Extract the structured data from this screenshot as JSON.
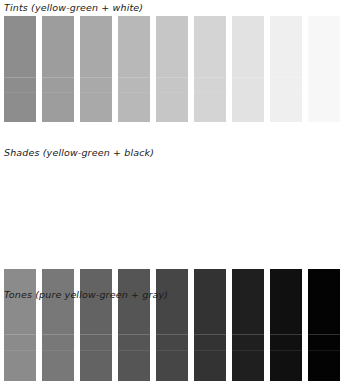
{
  "page": {
    "background": "#ffffff",
    "width": 341,
    "height": 307,
    "text_color": "#1a1a1a"
  },
  "sections": [
    {
      "id": "tints",
      "label": "Tints (yellow-green + white)",
      "description": "Nine swatches of yellow-green progressively mixed with white, reproduced in grayscale",
      "swatch_count": 9,
      "colors": [
        "#8d8d8d",
        "#9d9d9d",
        "#a9a9a9",
        "#b8b8b8",
        "#c6c6c6",
        "#d4d4d4",
        "#e2e2e2",
        "#efefef",
        "#f7f7f7"
      ]
    },
    {
      "id": "shades",
      "label": "Shades (yellow-green + black)",
      "description": "Nine swatches of yellow-green progressively mixed with black, reproduced in grayscale",
      "swatch_count": 9,
      "colors": [
        "#8b8b8b",
        "#787878",
        "#636363",
        "#555555",
        "#464646",
        "#333333",
        "#1f1f1f",
        "#101010",
        "#030303"
      ]
    },
    {
      "id": "tones",
      "label": "Tones (pure yellow-green + gray)",
      "description": "Section heading only; its swatch row is cut off below the bottom edge of the image",
      "swatch_count": 0,
      "colors": []
    }
  ],
  "swatch_geometry": {
    "left_margin": 4,
    "swatch_width": 32,
    "swatch_gap": 6,
    "pitch": 38
  }
}
